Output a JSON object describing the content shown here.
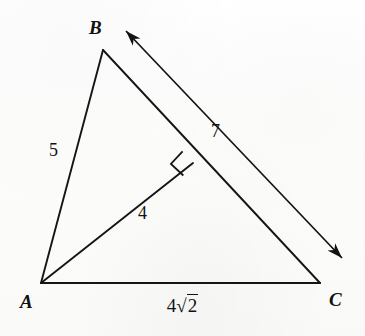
{
  "figure": {
    "type": "geometry-diagram",
    "stroke_color": "#151515",
    "background_color": "#fdfdfd"
  },
  "vertices": [
    {
      "id": "A",
      "label": "A",
      "x": 41,
      "y": 283
    },
    {
      "id": "B",
      "label": "B",
      "x": 103,
      "y": 50
    },
    {
      "id": "C",
      "label": "C",
      "x": 320,
      "y": 283
    },
    {
      "id": "D",
      "label": "",
      "x": 193,
      "y": 163
    }
  ],
  "segments": [
    {
      "name": "side-ab",
      "from": "A",
      "to": "B",
      "label": "5"
    },
    {
      "name": "side-bc",
      "from": "B",
      "to": "C",
      "label": ""
    },
    {
      "name": "side-ac",
      "from": "A",
      "to": "C",
      "label": "4√2"
    },
    {
      "name": "altitude-ad",
      "from": "A",
      "to": "D",
      "label": "4"
    }
  ],
  "labels": {
    "vertex_a": "A",
    "vertex_b": "B",
    "vertex_c": "C",
    "side_ab": "5",
    "altitude_ad": "4",
    "arrow_length": "7",
    "base_ac_coefficient": "4",
    "base_ac_radical_sign": "√",
    "base_ac_radicand": "2",
    "base_ac_full": "4√2"
  },
  "markers": {
    "right_angle": {
      "name": "right-angle-marker",
      "at_vertex": "D",
      "shape": "square",
      "size": 13
    }
  },
  "arrow": {
    "name": "double-headed-length-arrow",
    "label": "7",
    "parallel_to": "side-bc",
    "start_x": 126,
    "start_y": 31,
    "end_x": 342,
    "end_y": 258,
    "heads": "both"
  }
}
